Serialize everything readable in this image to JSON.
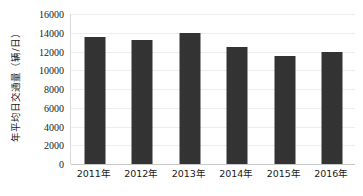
{
  "chart_data": {
    "type": "bar",
    "title": "",
    "xlabel": "",
    "ylabel": "年平均日交通量（辆/日）",
    "categories": [
      "2011年",
      "2012年",
      "2013年",
      "2014年",
      "2015年",
      "2016年"
    ],
    "values": [
      13500,
      13200,
      14000,
      12500,
      11500,
      11900
    ],
    "series": [
      {
        "name": "年平均日交通量",
        "values": [
          13500,
          13200,
          14000,
          12500,
          11500,
          11900
        ]
      }
    ],
    "ylim": [
      0,
      16000
    ],
    "y_ticks": [
      0,
      2000,
      4000,
      6000,
      8000,
      10000,
      12000,
      14000,
      16000
    ],
    "y_tick_labels": [
      "0",
      "2000",
      "4000",
      "6000",
      "8000",
      "10000",
      "12000",
      "14000",
      "16000"
    ],
    "x_tick_labels": [
      "2011年",
      "2012年",
      "2013年",
      "2014年",
      "2015年",
      "2016年"
    ],
    "grid": true,
    "grid_axis": "y",
    "legend": false,
    "legend_position": "none",
    "bar_color": "#333333",
    "gridline_color": "#ededed",
    "axis_color": "#c8c8c8",
    "text_color": "#1a1a1a"
  }
}
